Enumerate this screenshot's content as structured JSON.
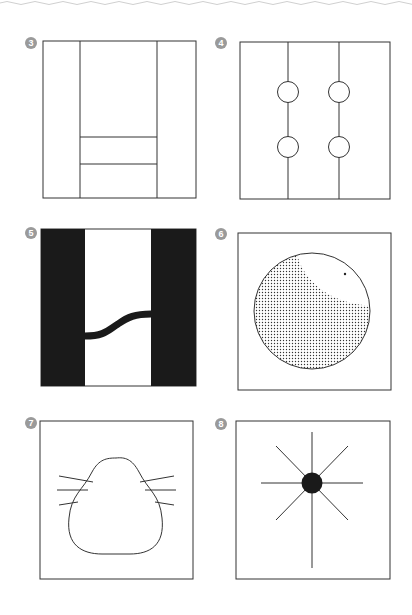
{
  "diagrams": [
    {
      "number": "3",
      "description": "Square divided into three vertical columns; middle column has two horizontal lines near bottom"
    },
    {
      "number": "4",
      "description": "Square with two vertical lines, each with two circles"
    },
    {
      "number": "5",
      "description": "Black outer columns with white center and wavy black band connecting them"
    },
    {
      "number": "6",
      "description": "Circle with dotted shading and white crescent at top right with small dot"
    },
    {
      "number": "7",
      "description": "Nose/cat-face shaped outline with whiskers on both sides"
    },
    {
      "number": "8",
      "description": "Black dot with eight radiating lines"
    }
  ],
  "colors": {
    "stroke": "#333333",
    "fill_dark": "#1a1a1a",
    "badge": "#9a9a9a",
    "border_top": "#cccccc"
  }
}
